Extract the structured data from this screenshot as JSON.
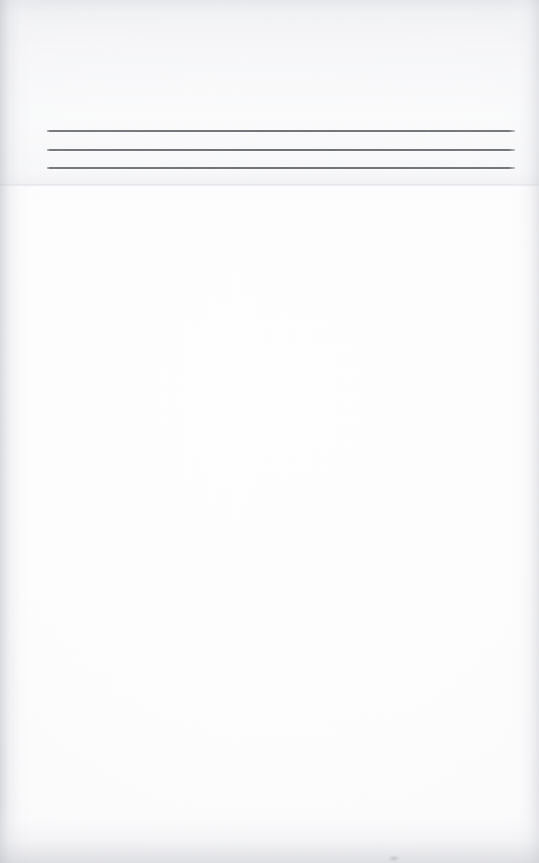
{
  "document": {
    "kind": "scanned-page",
    "page_background_color": "#fdfdfd",
    "rule_color": "#55565c",
    "heading": {
      "text": "",
      "legible": "no",
      "note": ""
    },
    "rules": [
      {
        "label": "",
        "y": 130
      },
      {
        "label": "",
        "y": 149
      },
      {
        "label": "",
        "y": 167
      }
    ],
    "body": {
      "text": ""
    }
  }
}
